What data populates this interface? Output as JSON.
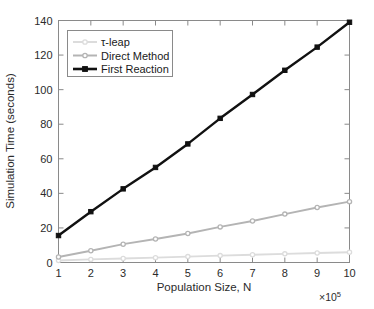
{
  "chart_data": {
    "type": "line",
    "title": "",
    "xlabel": "Population Size, N",
    "ylabel": "Simulation Time (seconds)",
    "x_exponent_label": "×10",
    "x_exponent_power": "5",
    "x": [
      1,
      2,
      3,
      4,
      5,
      6,
      7,
      8,
      9,
      10
    ],
    "xlim": [
      1,
      10
    ],
    "ylim": [
      0,
      140
    ],
    "x_ticks": [
      1,
      2,
      3,
      4,
      5,
      6,
      7,
      8,
      9,
      10
    ],
    "x_tick_labels": [
      "1",
      "2",
      "3",
      "4",
      "5",
      "6",
      "7",
      "8",
      "9",
      "10"
    ],
    "y_ticks": [
      0,
      20,
      40,
      60,
      80,
      100,
      120,
      140
    ],
    "y_tick_labels": [
      "0",
      "20",
      "40",
      "60",
      "80",
      "100",
      "120",
      "140"
    ],
    "grid": false,
    "legend_position": "upper left",
    "series": [
      {
        "name": "τ-leap",
        "color": "#dcdcdc",
        "marker": "circle",
        "values": [
          1.2,
          1.8,
          2.3,
          2.8,
          3.4,
          4.0,
          4.5,
          5.0,
          5.5,
          5.9
        ]
      },
      {
        "name": "Direct Method",
        "color": "#b4b4b4",
        "marker": "circle",
        "values": [
          3.2,
          6.8,
          10.6,
          13.6,
          16.8,
          20.6,
          24.0,
          28.0,
          31.8,
          35.2
        ]
      },
      {
        "name": "First Reaction",
        "color": "#111111",
        "marker": "square",
        "values": [
          15.6,
          29.4,
          42.6,
          55.0,
          68.6,
          83.4,
          97.2,
          111.2,
          124.6,
          139.0
        ]
      }
    ]
  },
  "legend": {
    "entries": [
      {
        "label": "τ-leap"
      },
      {
        "label": "Direct Method"
      },
      {
        "label": "First Reaction"
      }
    ]
  },
  "axes": {
    "y_title": "Simulation Time (seconds)",
    "x_title": "Population Size, N",
    "x_exp_base": "×10",
    "x_exp_power": "5"
  }
}
